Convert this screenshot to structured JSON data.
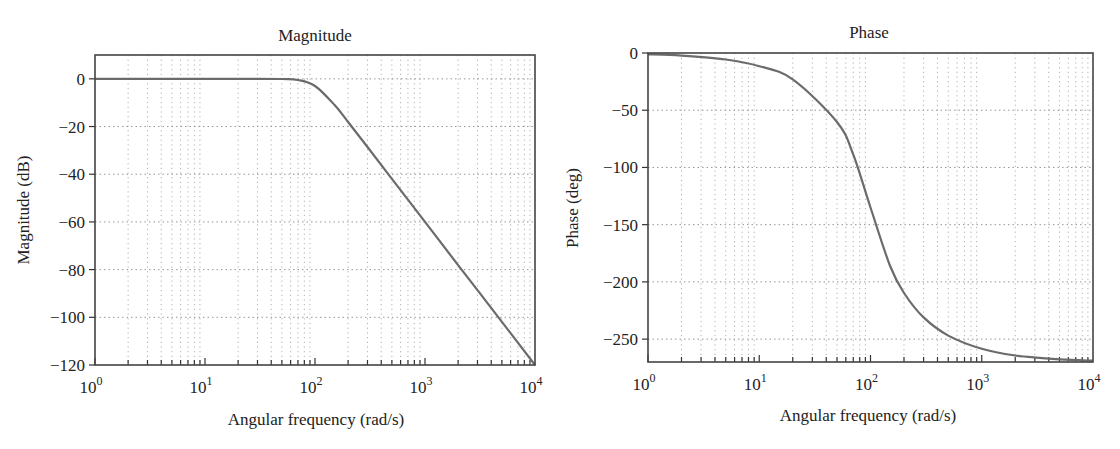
{
  "chart_data": [
    {
      "type": "line",
      "title": "Magnitude",
      "xlabel": "Angular frequency (rad/s)",
      "ylabel": "Magnitude (dB)",
      "xscale": "log",
      "xlim": [
        1,
        10000
      ],
      "ylim": [
        -120,
        10
      ],
      "grid": true,
      "legend": null,
      "x_tick_labels": [
        "10^0",
        "10^1",
        "10^2",
        "10^3",
        "10^4"
      ],
      "y_ticks": [
        0,
        -20,
        -40,
        -60,
        -80,
        -100,
        -120
      ],
      "series": [
        {
          "name": "Magnitude",
          "color": "#6b6b6b",
          "x": [
            1,
            2,
            5,
            10,
            20,
            50,
            70,
            100,
            150,
            200,
            300,
            500,
            1000,
            2000,
            5000,
            10000
          ],
          "y": [
            0,
            0,
            0,
            0,
            0,
            -0.07,
            -0.48,
            -3.0,
            -10.9,
            -18.1,
            -28.6,
            -41.9,
            -60.0,
            -78.1,
            -101.9,
            -120.0
          ]
        }
      ]
    },
    {
      "type": "line",
      "title": "Phase",
      "xlabel": "Angular frequency (rad/s)",
      "ylabel": "Phase (deg)",
      "xscale": "log",
      "xlim": [
        1,
        10000
      ],
      "ylim": [
        -270,
        0
      ],
      "grid": true,
      "legend": null,
      "x_tick_labels": [
        "10^0",
        "10^1",
        "10^2",
        "10^3",
        "10^4"
      ],
      "y_ticks": [
        0,
        -50,
        -100,
        -150,
        -200,
        -250
      ],
      "series": [
        {
          "name": "Phase",
          "color": "#6b6b6b",
          "x": [
            1,
            2,
            5,
            10,
            20,
            50,
            70,
            100,
            150,
            200,
            300,
            500,
            1000,
            2000,
            5000,
            10000
          ],
          "y": [
            -1.1,
            -2.3,
            -5.7,
            -11.5,
            -23.1,
            -60.3,
            -88.9,
            -135.0,
            -186.1,
            -209.7,
            -231.0,
            -246.9,
            -258.5,
            -264.3,
            -267.7,
            -268.9
          ]
        }
      ]
    }
  ],
  "magnitude": {
    "title": "Magnitude",
    "xlabel": "Angular frequency (rad/s)",
    "ylabel": "Magnitude (dB)",
    "yticks": [
      "0",
      "−20",
      "−40",
      "−60",
      "−80",
      "−100",
      "−120"
    ],
    "xticks": [
      {
        "base": "10",
        "exp": "0"
      },
      {
        "base": "10",
        "exp": "1"
      },
      {
        "base": "10",
        "exp": "2"
      },
      {
        "base": "10",
        "exp": "3"
      },
      {
        "base": "10",
        "exp": "4"
      }
    ]
  },
  "phase": {
    "title": "Phase",
    "xlabel": "Angular frequency (rad/s)",
    "ylabel": "Phase (deg)",
    "yticks": [
      "0",
      "−50",
      "−100",
      "−150",
      "−200",
      "−250"
    ],
    "xticks": [
      {
        "base": "10",
        "exp": "0"
      },
      {
        "base": "10",
        "exp": "1"
      },
      {
        "base": "10",
        "exp": "2"
      },
      {
        "base": "10",
        "exp": "3"
      },
      {
        "base": "10",
        "exp": "4"
      }
    ]
  }
}
